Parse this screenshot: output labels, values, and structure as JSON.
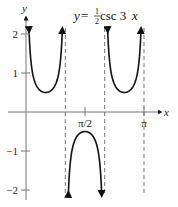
{
  "chart_data": {
    "type": "line",
    "title_parts": {
      "lhs": "y",
      "eq": " = ",
      "num": "1",
      "den": "2",
      "fn": " csc 3",
      "var": "x"
    },
    "xlabel": "x",
    "ylabel": "y",
    "function": "0.5*csc(3x)",
    "xlim": [
      0,
      3.14159
    ],
    "ylim": [
      -2.2,
      2.4
    ],
    "x_ticks": [
      {
        "value": 1.5708,
        "label": "π/2"
      },
      {
        "value": 3.14159,
        "label": "π"
      }
    ],
    "y_ticks": [
      {
        "value": 2,
        "label": "2"
      },
      {
        "value": 1,
        "label": "1"
      },
      {
        "value": -1,
        "label": "−1"
      },
      {
        "value": -2,
        "label": "−2"
      }
    ],
    "asymptotes": [
      1.0472,
      2.0944,
      3.14159
    ],
    "branches": [
      {
        "from": 0.0,
        "to": 1.0472,
        "sign": 1
      },
      {
        "from": 1.0472,
        "to": 2.0944,
        "sign": -1
      },
      {
        "from": 2.0944,
        "to": 3.14159,
        "sign": 1
      }
    ],
    "grid": false
  }
}
